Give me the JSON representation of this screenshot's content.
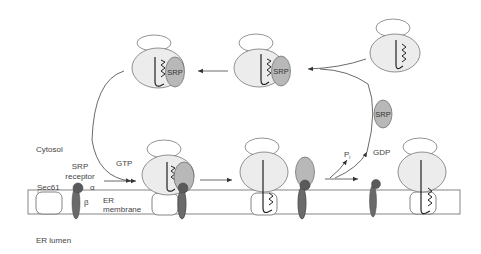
{
  "labels": {
    "cytosol": "Cytosol",
    "er_lumen": "ER lumen",
    "sec61": "Sec61",
    "srp_receptor_line1": "SRP",
    "srp_receptor_line2": "receptor",
    "alpha": "α",
    "beta": "β",
    "er_membrane_line1": "ER",
    "er_membrane_line2": "membrane",
    "gtp": "GTP",
    "gdp": "GDP",
    "pi": "P",
    "pi_sub": "i",
    "srp": "SRP"
  },
  "colors": {
    "ribosome_fill": "#ececec",
    "srp_fill": "#b8b8b8",
    "receptor_fill": "#6a6a6a",
    "receptor_head": "#5a5a5a",
    "stroke": "#555555",
    "membrane_fill": "#ffffff"
  },
  "stages": [
    {
      "id": "free-ribosome",
      "description": "Ribosome with nascent chain and signal sequence"
    },
    {
      "id": "srp-bound",
      "description": "SRP binds signal sequence"
    },
    {
      "id": "srp-arrested",
      "description": "SRP-ribosome complex (translation arrest)"
    },
    {
      "id": "receptor-docking",
      "description": "SRP-ribosome docks to SRP receptor with GTP"
    },
    {
      "id": "transfer-to-sec61",
      "description": "Ribosome transferred to Sec61; SRP released"
    },
    {
      "id": "translocation",
      "description": "Nascent chain translocating through Sec61"
    },
    {
      "id": "free-srp",
      "description": "Free SRP recycled to cytosol"
    }
  ]
}
